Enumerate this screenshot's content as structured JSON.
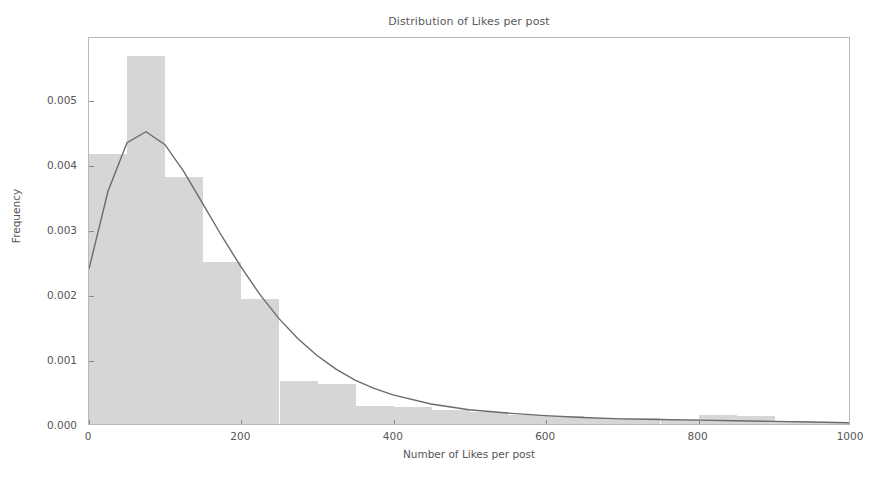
{
  "chart_data": {
    "type": "bar",
    "title": "Distribution of Likes per post",
    "xlabel": "Number of Likes per post",
    "ylabel": "Frequency",
    "xlim": [
      0,
      1000
    ],
    "ylim": [
      0.0,
      0.00597
    ],
    "grid": false,
    "legend": null,
    "xticks": [
      0,
      200,
      400,
      600,
      800,
      1000
    ],
    "xtick_labels": [
      "0",
      "200",
      "400",
      "600",
      "800",
      "1000"
    ],
    "yticks": [
      0.0,
      0.001,
      0.002,
      0.003,
      0.004,
      0.005
    ],
    "ytick_labels": [
      "0.000",
      "0.001",
      "0.002",
      "0.003",
      "0.004",
      "0.005"
    ],
    "bar_color": "#d6d6d6",
    "curve_color": "#6b6b6b",
    "axis_color": "#b9b9b9",
    "text_color": "#555555",
    "bin_width": 50,
    "bin_edges": [
      0,
      50,
      100,
      150,
      200,
      250,
      300,
      350,
      400,
      450,
      500,
      550,
      600,
      650,
      700,
      750,
      800,
      850,
      900,
      950,
      1000
    ],
    "bin_centers": [
      25,
      75,
      125,
      175,
      225,
      275,
      325,
      375,
      425,
      475,
      525,
      575,
      625,
      675,
      725,
      775,
      825,
      875,
      925,
      975
    ],
    "values": [
      0.00415,
      0.00566,
      0.0038,
      0.0025,
      0.00192,
      0.00066,
      0.00062,
      0.00028,
      0.00026,
      0.00022,
      0.00018,
      0.00014,
      0.00012,
      0.0001,
      9e-05,
      8e-05,
      0.00014,
      0.00013,
      4e-05,
      3e-05
    ],
    "series": [
      {
        "name": "Histogram (density)",
        "type": "bar",
        "values": [
          0.00415,
          0.00566,
          0.0038,
          0.0025,
          0.00192,
          0.00066,
          0.00062,
          0.00028,
          0.00026,
          0.00022,
          0.00018,
          0.00014,
          0.00012,
          0.0001,
          9e-05,
          8e-05,
          0.00014,
          0.00013,
          4e-05,
          3e-05
        ]
      },
      {
        "name": "KDE / fitted density curve",
        "type": "line",
        "x": [
          0,
          25,
          50,
          75,
          100,
          125,
          150,
          175,
          200,
          225,
          250,
          275,
          300,
          325,
          350,
          375,
          400,
          450,
          500,
          550,
          600,
          650,
          700,
          750,
          800,
          850,
          900,
          950,
          1000
        ],
        "y": [
          0.0024,
          0.0036,
          0.00435,
          0.00452,
          0.00432,
          0.0039,
          0.0034,
          0.0029,
          0.00243,
          0.002,
          0.00163,
          0.00132,
          0.00106,
          0.00085,
          0.00068,
          0.00055,
          0.00045,
          0.00031,
          0.00022,
          0.00017,
          0.00013,
          0.0001,
          8e-05,
          7e-05,
          6e-05,
          5e-05,
          4e-05,
          3e-05,
          2e-05
        ]
      }
    ]
  },
  "figure": {
    "background": "#ffffff"
  }
}
